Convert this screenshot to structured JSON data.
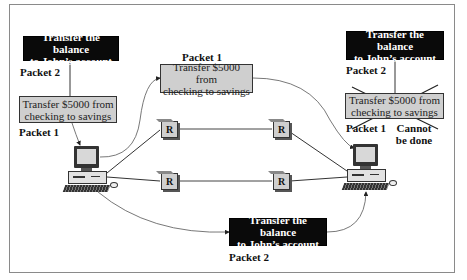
{
  "diagram": {
    "sender": {
      "packet2": {
        "text_line1": "Transfer the balance",
        "text_line2": "to John’s account",
        "label": "Packet 2"
      },
      "packet1": {
        "text_line1": "Transfer $5000 from",
        "text_line2": "checking to savings",
        "label": "Packet 1"
      }
    },
    "route_top": {
      "packet1": {
        "label": "Packet 1",
        "text_line1": "Transfer $5000 from",
        "text_line2": "checking to savings"
      }
    },
    "route_bottom": {
      "packet2": {
        "text_line1": "Transfer the balance",
        "text_line2": "to John’s account",
        "label": "Packet 2"
      }
    },
    "receiver": {
      "packet2": {
        "text_line1": "Transfer the balance",
        "text_line2": "to John’s account",
        "label": "Packet 2"
      },
      "packet1": {
        "text_line1": "Transfer $5000 from",
        "text_line2": "checking to savings",
        "label": "Packet 1"
      },
      "status_line1": "Cannot",
      "status_line2": "be done"
    },
    "routers": [
      "R",
      "R",
      "R",
      "R"
    ],
    "colors": {
      "black_box": "#0a0a0a",
      "grey_box": "#cfcfcf",
      "line": "#333333"
    }
  }
}
